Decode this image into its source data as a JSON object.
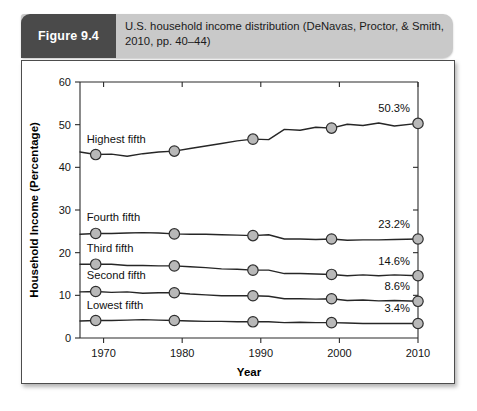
{
  "figure": {
    "tag": "Figure 9.4",
    "caption": "U.S. household income distribution (DeNavas, Proctor, & Smith, 2010, pp. 40–44)"
  },
  "colors": {
    "tag_background": "#4a4a4a",
    "caption_background": "#c9c9c9",
    "panel_background": "#ffffff",
    "panel_border": "#4d4d4d",
    "line": "#262626",
    "marker_fill": "#b8b8b8",
    "marker_stroke": "#2e2e2e",
    "text": "#111111"
  },
  "chart_data": {
    "type": "line",
    "title": "U.S. household income distribution (DeNavas, Proctor, & Smith, 2010, pp. 40–44)",
    "xlabel": "Year",
    "ylabel": "Household Income (Percentage)",
    "xlim": [
      1967,
      2010
    ],
    "ylim": [
      0,
      60
    ],
    "grid": false,
    "legend_position": "inline-left-labels",
    "x_ticks": [
      "1970",
      "1980",
      "1990",
      "2000",
      "2010"
    ],
    "x_tick_values": [
      1970,
      1980,
      1990,
      2000,
      2010
    ],
    "y_ticks": [
      "0",
      "10",
      "20",
      "30",
      "40",
      "50",
      "60"
    ],
    "y_tick_values": [
      0,
      10,
      20,
      30,
      40,
      50,
      60
    ],
    "marker_x": [
      1969,
      1979,
      1989,
      1999,
      2010
    ],
    "series": [
      {
        "name": "Highest fifth",
        "label": "Highest fifth",
        "end_value_label": "50.3%",
        "marker_values": [
          43.0,
          43.8,
          46.6,
          49.2,
          50.3
        ],
        "x": [
          1967,
          1969,
          1971,
          1973,
          1975,
          1977,
          1979,
          1981,
          1983,
          1985,
          1987,
          1989,
          1991,
          1993,
          1995,
          1997,
          1999,
          2001,
          2003,
          2005,
          2007,
          2010
        ],
        "values": [
          43.6,
          43.0,
          43.1,
          42.6,
          43.2,
          43.6,
          43.8,
          44.4,
          45.0,
          45.6,
          46.2,
          46.6,
          46.5,
          48.9,
          48.7,
          49.4,
          49.2,
          50.1,
          49.8,
          50.4,
          49.7,
          50.3
        ]
      },
      {
        "name": "Fourth fifth",
        "label": "Fourth fifth",
        "end_value_label": "23.2%",
        "marker_values": [
          24.5,
          24.4,
          24.0,
          23.2,
          23.2
        ],
        "x": [
          1967,
          1969,
          1971,
          1973,
          1975,
          1977,
          1979,
          1981,
          1983,
          1985,
          1987,
          1989,
          1991,
          1993,
          1995,
          1997,
          1999,
          2001,
          2003,
          2005,
          2007,
          2010
        ],
        "values": [
          24.3,
          24.5,
          24.5,
          24.6,
          24.7,
          24.6,
          24.4,
          24.3,
          24.3,
          24.2,
          24.1,
          24.0,
          24.2,
          23.2,
          23.2,
          23.1,
          23.2,
          22.9,
          23.0,
          23.0,
          23.1,
          23.2
        ]
      },
      {
        "name": "Third fifth",
        "label": "Third fifth",
        "end_value_label": "14.6%",
        "marker_values": [
          17.3,
          16.9,
          15.9,
          14.9,
          14.6
        ],
        "x": [
          1967,
          1969,
          1971,
          1973,
          1975,
          1977,
          1979,
          1981,
          1983,
          1985,
          1987,
          1989,
          1991,
          1993,
          1995,
          1997,
          1999,
          2001,
          2003,
          2005,
          2007,
          2010
        ],
        "values": [
          17.3,
          17.3,
          17.3,
          17.0,
          17.0,
          16.9,
          16.9,
          16.7,
          16.5,
          16.2,
          16.1,
          15.9,
          15.9,
          15.1,
          15.1,
          15.0,
          14.9,
          14.6,
          14.8,
          14.6,
          14.8,
          14.6
        ]
      },
      {
        "name": "Second fifth",
        "label": "Second fifth",
        "end_value_label": "8.6%",
        "marker_values": [
          10.9,
          10.6,
          9.9,
          9.2,
          8.6
        ],
        "x": [
          1967,
          1969,
          1971,
          1973,
          1975,
          1977,
          1979,
          1981,
          1983,
          1985,
          1987,
          1989,
          1991,
          1993,
          1995,
          1997,
          1999,
          2001,
          2003,
          2005,
          2007,
          2010
        ],
        "values": [
          10.8,
          10.9,
          10.7,
          10.8,
          10.5,
          10.6,
          10.6,
          10.3,
          10.1,
          9.9,
          9.9,
          9.9,
          9.8,
          9.2,
          9.2,
          9.1,
          9.2,
          8.8,
          8.9,
          8.7,
          8.8,
          8.6
        ]
      },
      {
        "name": "Lowest fifth",
        "label": "Lowest fifth",
        "end_value_label": "3.4%",
        "marker_values": [
          4.1,
          4.1,
          3.8,
          3.6,
          3.4
        ],
        "x": [
          1967,
          1969,
          1971,
          1973,
          1975,
          1977,
          1979,
          1981,
          1983,
          1985,
          1987,
          1989,
          1991,
          1993,
          1995,
          1997,
          1999,
          2001,
          2003,
          2005,
          2007,
          2010
        ],
        "values": [
          4.0,
          4.1,
          4.1,
          4.2,
          4.3,
          4.2,
          4.1,
          4.0,
          3.9,
          3.9,
          3.8,
          3.8,
          3.8,
          3.6,
          3.7,
          3.6,
          3.6,
          3.5,
          3.4,
          3.4,
          3.4,
          3.4
        ]
      }
    ]
  }
}
